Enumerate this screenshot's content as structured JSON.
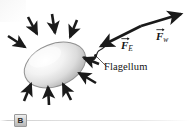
{
  "figure": {
    "panel_label": "B",
    "background_color": "#ffffff",
    "ink_color": "#1a1a1a",
    "cell": {
      "name": "bacterium-cell-body",
      "shape": "ellipse",
      "fill_light": "#fdfdfd",
      "fill_shadow": "#b9b9b9",
      "outline": "#8f8f8f",
      "cx": 55,
      "cy": 65,
      "rx": 32,
      "ry": 21,
      "rotation_deg": -22
    },
    "flagellum": {
      "name": "flagellum",
      "label": "Flagellum",
      "description": "wavy tail attached at right end of the cell"
    },
    "labels": {
      "flagellum": "Flagellum",
      "force_electric_symbol": "F",
      "force_electric_subscript": "E",
      "force_water_symbol": "F",
      "force_water_subscript": "w"
    },
    "vectors": [
      {
        "name": "force-electric-vector",
        "label": "F_E",
        "symbol": "F",
        "subscript": "E",
        "direction": "down-left",
        "tail_x": 141,
        "tail_y": 26,
        "tip_x": 99,
        "tip_y": 47
      },
      {
        "name": "force-water-vector",
        "label": "F_w",
        "symbol": "F",
        "subscript": "w",
        "direction": "up-right",
        "tail_x": 141,
        "tail_y": 26,
        "tip_x": 182,
        "tip_y": 13
      }
    ],
    "inward_arrows": {
      "name": "inward-force-arrows",
      "count": 9,
      "description": "short bold arrows pointing inward toward the cell surface from all sides",
      "arrows": [
        {
          "x1": 8,
          "y1": 36,
          "x2": 26,
          "y2": 48
        },
        {
          "x1": 28,
          "y1": 17,
          "x2": 38,
          "y2": 35
        },
        {
          "x1": 52,
          "y1": 14,
          "x2": 55,
          "y2": 34
        },
        {
          "x1": 76,
          "y1": 20,
          "x2": 70,
          "y2": 38
        },
        {
          "x1": 99,
          "y1": 63,
          "x2": 83,
          "y2": 57
        },
        {
          "x1": 96,
          "y1": 82,
          "x2": 78,
          "y2": 73
        },
        {
          "x1": 70,
          "y1": 99,
          "x2": 62,
          "y2": 83
        },
        {
          "x1": 48,
          "y1": 104,
          "x2": 47,
          "y2": 86
        },
        {
          "x1": 25,
          "y1": 101,
          "x2": 31,
          "y2": 83
        }
      ]
    }
  }
}
